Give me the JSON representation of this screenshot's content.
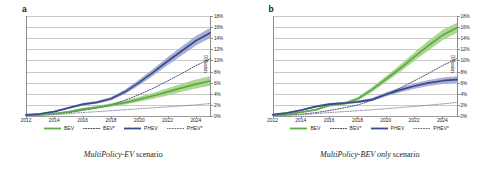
{
  "figure": {
    "panels": [
      {
        "letter": "a",
        "caption_italic": "MultiPolicy-EV",
        "caption_rest": " scenario",
        "ylabel": "Diffusion"
      },
      {
        "letter": "b",
        "caption_italic": "MultiPolicy-BEV only",
        "caption_rest": " scenario",
        "ylabel": "Diffusion"
      }
    ],
    "legend": [
      {
        "label": "BEV",
        "style": "solid",
        "color": "#5cab45"
      },
      {
        "label": "BEV*",
        "style": "dotted",
        "color": "#3c3c3c"
      },
      {
        "label": "PHEV",
        "style": "solid",
        "color": "#3b4a8f"
      },
      {
        "label": "PHEV*",
        "style": "dotted",
        "color": "#6b6b6b"
      }
    ],
    "colors": {
      "bev_line": "#5cab45",
      "bev_band": "#8fc96e",
      "phev_line": "#3b4a8f",
      "phev_band": "#8e97c4",
      "dotted_dark": "#2f3a6b",
      "dotted_light": "#7a8498",
      "grid": "#c9c9c9",
      "axis": "#8d8d8d"
    }
  },
  "chart_data": [
    {
      "type": "line",
      "title": "MultiPolicy-EV scenario",
      "panel": "a",
      "xlabel": "",
      "ylabel": "Diffusion",
      "xlim": [
        2012,
        2025
      ],
      "ylim": [
        0,
        18
      ],
      "yticks": [
        "0%",
        "2%",
        "4%",
        "6%",
        "8%",
        "10%",
        "12%",
        "14%",
        "16%",
        "18%"
      ],
      "xticks": [
        "2012",
        "2014",
        "2016",
        "2018",
        "2020",
        "2022",
        "2024"
      ],
      "grid": true,
      "legend_position": "bottom",
      "x": [
        2012,
        2013,
        2014,
        2015,
        2016,
        2017,
        2018,
        2019,
        2020,
        2021,
        2022,
        2023,
        2024,
        2025
      ],
      "series": [
        {
          "name": "BEV",
          "style": "solid-band",
          "color": "#5cab45",
          "values": [
            0.15,
            0.25,
            0.45,
            0.75,
            1.25,
            1.55,
            1.95,
            2.4,
            3.0,
            3.65,
            4.35,
            5.05,
            5.75,
            6.3
          ],
          "band_lo": [
            0.1,
            0.2,
            0.38,
            0.62,
            1.05,
            1.3,
            1.65,
            2.05,
            2.55,
            3.1,
            3.7,
            4.35,
            4.95,
            5.45
          ],
          "band_hi": [
            0.2,
            0.32,
            0.55,
            0.92,
            1.45,
            1.82,
            2.3,
            2.8,
            3.45,
            4.2,
            5.0,
            5.8,
            6.55,
            7.15
          ]
        },
        {
          "name": "BEV*",
          "style": "dotted",
          "color": "#2f3a6b",
          "values": [
            0.1,
            0.18,
            0.32,
            0.6,
            1.0,
            1.45,
            2.0,
            2.85,
            3.85,
            5.0,
            6.3,
            7.65,
            9.05,
            10.3
          ]
        },
        {
          "name": "PHEV",
          "style": "solid-band",
          "color": "#3b4a8f",
          "values": [
            0.2,
            0.4,
            0.8,
            1.45,
            2.1,
            2.45,
            3.1,
            4.35,
            6.05,
            7.9,
            9.85,
            11.7,
            13.55,
            14.95
          ],
          "band_lo": [
            0.15,
            0.33,
            0.68,
            1.28,
            1.9,
            2.2,
            2.8,
            3.95,
            5.55,
            7.3,
            9.15,
            10.9,
            12.7,
            14.05
          ],
          "band_hi": [
            0.26,
            0.48,
            0.93,
            1.62,
            2.32,
            2.72,
            3.42,
            4.78,
            6.58,
            8.52,
            10.58,
            12.52,
            14.42,
            15.85
          ]
        },
        {
          "name": "PHEV*",
          "style": "dotted",
          "color": "#7a8498",
          "values": [
            0.08,
            0.14,
            0.24,
            0.42,
            0.62,
            0.78,
            0.95,
            1.12,
            1.3,
            1.48,
            1.65,
            1.82,
            2.0,
            2.25
          ]
        }
      ]
    },
    {
      "type": "line",
      "title": "MultiPolicy-BEV only scenario",
      "panel": "b",
      "xlabel": "",
      "ylabel": "Diffusion",
      "xlim": [
        2012,
        2025
      ],
      "ylim": [
        0,
        18
      ],
      "yticks": [
        "0%",
        "2%",
        "4%",
        "6%",
        "8%",
        "10%",
        "12%",
        "14%",
        "16%",
        "18%"
      ],
      "xticks": [
        "2012",
        "2014",
        "2016",
        "2018",
        "2020",
        "2022",
        "2024"
      ],
      "grid": true,
      "legend_position": "bottom",
      "x": [
        2012,
        2013,
        2014,
        2015,
        2016,
        2017,
        2018,
        2019,
        2020,
        2021,
        2022,
        2023,
        2024,
        2025
      ],
      "series": [
        {
          "name": "BEV",
          "style": "solid-band",
          "color": "#5cab45",
          "values": [
            0.15,
            0.3,
            0.7,
            1.1,
            1.95,
            2.2,
            3.1,
            4.75,
            6.65,
            8.6,
            10.7,
            12.7,
            14.6,
            15.9
          ],
          "band_lo": [
            0.1,
            0.24,
            0.58,
            0.95,
            1.72,
            1.95,
            2.78,
            4.3,
            6.1,
            7.95,
            9.95,
            11.85,
            13.7,
            14.95
          ],
          "band_hi": [
            0.21,
            0.37,
            0.83,
            1.26,
            2.18,
            2.47,
            3.44,
            5.22,
            7.22,
            9.28,
            11.48,
            13.58,
            15.52,
            16.8
          ]
        },
        {
          "name": "BEV*",
          "style": "dotted",
          "color": "#2f3a6b",
          "values": [
            0.1,
            0.18,
            0.32,
            0.6,
            1.0,
            1.45,
            2.0,
            2.85,
            3.9,
            5.05,
            6.35,
            7.7,
            9.1,
            10.35
          ]
        },
        {
          "name": "PHEV",
          "style": "solid-band",
          "color": "#3b4a8f",
          "values": [
            0.25,
            0.55,
            1.05,
            1.7,
            2.15,
            2.3,
            2.55,
            2.95,
            3.9,
            4.7,
            5.4,
            5.95,
            6.35,
            6.55
          ],
          "band_lo": [
            0.2,
            0.47,
            0.93,
            1.53,
            1.95,
            2.1,
            2.32,
            2.68,
            3.55,
            4.28,
            4.92,
            5.42,
            5.78,
            5.98
          ],
          "band_hi": [
            0.31,
            0.63,
            1.18,
            1.88,
            2.35,
            2.52,
            2.8,
            3.24,
            4.26,
            5.14,
            5.9,
            6.5,
            6.94,
            7.16
          ]
        },
        {
          "name": "PHEV*",
          "style": "dotted",
          "color": "#7a8498",
          "values": [
            0.08,
            0.14,
            0.24,
            0.42,
            0.62,
            0.78,
            0.95,
            1.12,
            1.32,
            1.52,
            1.72,
            1.95,
            2.18,
            2.45
          ]
        }
      ]
    }
  ]
}
